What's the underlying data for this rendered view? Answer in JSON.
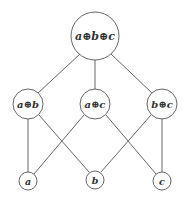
{
  "diagram": {
    "type": "lattice",
    "colors": {
      "stroke": "#555555",
      "text": "#333333",
      "background": "#ffffff"
    },
    "nodes": [
      {
        "id": "abc",
        "label": "a⊕b⊕c",
        "level": 0
      },
      {
        "id": "ab",
        "label": "a⊕b",
        "level": 1
      },
      {
        "id": "ac",
        "label": "a⊕c",
        "level": 1
      },
      {
        "id": "bc",
        "label": "b⊕c",
        "level": 1
      },
      {
        "id": "a",
        "label": "a",
        "level": 2
      },
      {
        "id": "b",
        "label": "b",
        "level": 2
      },
      {
        "id": "c",
        "label": "c",
        "level": 2
      }
    ],
    "edges": [
      {
        "from": "abc",
        "to": "ab"
      },
      {
        "from": "abc",
        "to": "ac"
      },
      {
        "from": "abc",
        "to": "bc"
      },
      {
        "from": "ab",
        "to": "a"
      },
      {
        "from": "ab",
        "to": "b"
      },
      {
        "from": "ac",
        "to": "a"
      },
      {
        "from": "ac",
        "to": "c"
      },
      {
        "from": "bc",
        "to": "b"
      },
      {
        "from": "bc",
        "to": "c"
      }
    ]
  }
}
